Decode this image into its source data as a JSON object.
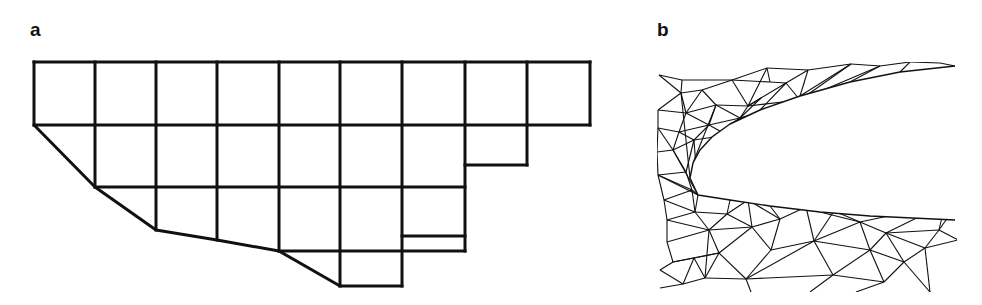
{
  "panels": [
    {
      "label": "a",
      "title": "structured quadrilateral grid with stair-step cells and cut boundary"
    },
    {
      "label": "b",
      "title": "unstructured triangular mesh around leading edge"
    }
  ],
  "colors": {
    "line": "#111111",
    "background": "#ffffff"
  },
  "grid_a": {
    "stroke_width": 3,
    "segments": [
      [
        34,
        62,
        590,
        62
      ],
      [
        34,
        125,
        590,
        125
      ],
      [
        95,
        187,
        465,
        187
      ],
      [
        279,
        251,
        465,
        251
      ],
      [
        340,
        286,
        402,
        286
      ],
      [
        465,
        165,
        527,
        165
      ],
      [
        402,
        236,
        465,
        236
      ],
      [
        34,
        62,
        34,
        125
      ],
      [
        95,
        62,
        95,
        187
      ],
      [
        156,
        62,
        156,
        230
      ],
      [
        217,
        62,
        217,
        240
      ],
      [
        279,
        62,
        279,
        251
      ],
      [
        340,
        62,
        340,
        286
      ],
      [
        402,
        62,
        402,
        286
      ],
      [
        465,
        62,
        465,
        251
      ],
      [
        527,
        62,
        527,
        165
      ],
      [
        590,
        62,
        590,
        125
      ]
    ],
    "boundary": [
      [
        34,
        125
      ],
      [
        95,
        187
      ],
      [
        156,
        230
      ],
      [
        217,
        240
      ],
      [
        279,
        251
      ],
      [
        340,
        286
      ]
    ]
  },
  "mesh_b": {
    "stroke_width": 1.1,
    "body_upper": [
      [
        955,
        66
      ],
      [
        900,
        72
      ],
      [
        850,
        82
      ],
      [
        800,
        96
      ],
      [
        760,
        110
      ],
      [
        730,
        124
      ],
      [
        712,
        137
      ],
      [
        700,
        150
      ],
      [
        693,
        163
      ],
      [
        690,
        178
      ],
      [
        698,
        195
      ]
    ],
    "body_lower": [
      [
        698,
        195
      ],
      [
        730,
        200
      ],
      [
        770,
        206
      ],
      [
        820,
        212
      ],
      [
        870,
        216
      ],
      [
        955,
        220
      ]
    ],
    "nodes": [
      [
        659,
        75
      ],
      [
        682,
        80
      ],
      [
        732,
        80
      ],
      [
        767,
        68
      ],
      [
        808,
        70
      ],
      [
        851,
        64
      ],
      [
        880,
        66
      ],
      [
        910,
        62
      ],
      [
        940,
        63
      ],
      [
        681,
        93
      ],
      [
        702,
        90
      ],
      [
        716,
        105
      ],
      [
        748,
        106
      ],
      [
        740,
        118
      ],
      [
        761,
        98
      ],
      [
        786,
        83
      ],
      [
        800,
        100
      ],
      [
        770,
        82
      ],
      [
        658,
        110
      ],
      [
        686,
        113
      ],
      [
        709,
        125
      ],
      [
        727,
        135
      ],
      [
        694,
        140
      ],
      [
        673,
        150
      ],
      [
        658,
        128
      ],
      [
        679,
        132
      ],
      [
        657,
        152
      ],
      [
        658,
        175
      ],
      [
        686,
        172
      ],
      [
        692,
        190
      ],
      [
        664,
        200
      ],
      [
        667,
        220
      ],
      [
        695,
        212
      ],
      [
        709,
        230
      ],
      [
        727,
        214
      ],
      [
        748,
        200
      ],
      [
        752,
        227
      ],
      [
        719,
        253
      ],
      [
        705,
        278
      ],
      [
        746,
        279
      ],
      [
        771,
        250
      ],
      [
        780,
        219
      ],
      [
        806,
        207
      ],
      [
        814,
        241
      ],
      [
        833,
        275
      ],
      [
        834,
        211
      ],
      [
        860,
        222
      ],
      [
        870,
        250
      ],
      [
        884,
        282
      ],
      [
        886,
        233
      ],
      [
        904,
        262
      ],
      [
        925,
        248
      ],
      [
        939,
        230
      ],
      [
        945,
        204
      ],
      [
        953,
        210
      ],
      [
        958,
        240
      ],
      [
        667,
        242
      ],
      [
        673,
        262
      ],
      [
        694,
        258
      ],
      [
        683,
        284
      ],
      [
        660,
        270
      ],
      [
        660,
        288
      ],
      [
        751,
        292
      ],
      [
        810,
        292
      ],
      [
        856,
        292
      ],
      [
        930,
        292
      ]
    ],
    "edges": [
      [
        0,
        1
      ],
      [
        1,
        2
      ],
      [
        2,
        3
      ],
      [
        3,
        4
      ],
      [
        4,
        5
      ],
      [
        5,
        6
      ],
      [
        6,
        7
      ],
      [
        7,
        8
      ],
      [
        0,
        9
      ],
      [
        1,
        9
      ],
      [
        9,
        10
      ],
      [
        10,
        2
      ],
      [
        10,
        11
      ],
      [
        11,
        12
      ],
      [
        12,
        2
      ],
      [
        2,
        17
      ],
      [
        17,
        3
      ],
      [
        3,
        12
      ],
      [
        12,
        14
      ],
      [
        14,
        13
      ],
      [
        13,
        11
      ],
      [
        12,
        13
      ],
      [
        17,
        15
      ],
      [
        15,
        4
      ],
      [
        15,
        16
      ],
      [
        16,
        12
      ],
      [
        16,
        13
      ],
      [
        15,
        14
      ],
      [
        14,
        12
      ],
      [
        5,
        16
      ],
      [
        6,
        16
      ],
      [
        9,
        18
      ],
      [
        18,
        19
      ],
      [
        19,
        9
      ],
      [
        19,
        10
      ],
      [
        19,
        11
      ],
      [
        19,
        20
      ],
      [
        20,
        11
      ],
      [
        20,
        13
      ],
      [
        20,
        21
      ],
      [
        21,
        13
      ],
      [
        21,
        22
      ],
      [
        22,
        20
      ],
      [
        22,
        23
      ],
      [
        23,
        25
      ],
      [
        25,
        22
      ],
      [
        25,
        20
      ],
      [
        25,
        19
      ],
      [
        24,
        25
      ],
      [
        24,
        18
      ],
      [
        24,
        23
      ],
      [
        23,
        26
      ],
      [
        26,
        24
      ],
      [
        26,
        27
      ],
      [
        27,
        28
      ],
      [
        28,
        23
      ],
      [
        28,
        22
      ],
      [
        28,
        29
      ],
      [
        29,
        27
      ],
      [
        27,
        30
      ],
      [
        30,
        29
      ],
      [
        29,
        32
      ],
      [
        32,
        30
      ],
      [
        30,
        31
      ],
      [
        31,
        32
      ],
      [
        32,
        33
      ],
      [
        33,
        31
      ],
      [
        32,
        34
      ],
      [
        34,
        33
      ],
      [
        34,
        35
      ],
      [
        35,
        36
      ],
      [
        36,
        34
      ],
      [
        36,
        33
      ],
      [
        33,
        37
      ],
      [
        37,
        36
      ],
      [
        37,
        38
      ],
      [
        38,
        33
      ],
      [
        31,
        56
      ],
      [
        56,
        33
      ],
      [
        56,
        57
      ],
      [
        57,
        37
      ],
      [
        57,
        58
      ],
      [
        58,
        37
      ],
      [
        58,
        38
      ],
      [
        58,
        59
      ],
      [
        59,
        38
      ],
      [
        57,
        60
      ],
      [
        60,
        59
      ],
      [
        59,
        61
      ],
      [
        35,
        41
      ],
      [
        41,
        36
      ],
      [
        36,
        40
      ],
      [
        40,
        41
      ],
      [
        41,
        42
      ],
      [
        42,
        43
      ],
      [
        43,
        40
      ],
      [
        40,
        39
      ],
      [
        39,
        37
      ],
      [
        39,
        38
      ],
      [
        39,
        62
      ],
      [
        43,
        39
      ],
      [
        43,
        44
      ],
      [
        44,
        39
      ],
      [
        44,
        63
      ],
      [
        42,
        45
      ],
      [
        45,
        43
      ],
      [
        45,
        46
      ],
      [
        46,
        43
      ],
      [
        46,
        47
      ],
      [
        47,
        43
      ],
      [
        47,
        44
      ],
      [
        47,
        48
      ],
      [
        48,
        44
      ],
      [
        48,
        64
      ],
      [
        46,
        49
      ],
      [
        49,
        47
      ],
      [
        49,
        50
      ],
      [
        50,
        47
      ],
      [
        50,
        48
      ],
      [
        49,
        51
      ],
      [
        51,
        50
      ],
      [
        51,
        52
      ],
      [
        52,
        49
      ],
      [
        52,
        53
      ],
      [
        53,
        49
      ],
      [
        53,
        54
      ],
      [
        54,
        52
      ],
      [
        52,
        55
      ],
      [
        55,
        51
      ],
      [
        50,
        65
      ],
      [
        51,
        65
      ],
      [
        46,
        53
      ],
      [
        45,
        53
      ]
    ],
    "boundary_ties": [
      [
        9,
        "u",
        9
      ],
      [
        11,
        "u",
        8
      ],
      [
        13,
        "u",
        6
      ],
      [
        16,
        "u",
        5
      ],
      [
        15,
        "u",
        4
      ],
      [
        23,
        "u",
        10
      ],
      [
        22,
        "u",
        10
      ],
      [
        27,
        "u",
        10
      ],
      [
        29,
        "l",
        0
      ],
      [
        32,
        "l",
        0
      ],
      [
        34,
        "l",
        1
      ],
      [
        35,
        "l",
        1
      ],
      [
        41,
        "l",
        2
      ],
      [
        42,
        "l",
        2
      ],
      [
        45,
        "l",
        3
      ],
      [
        46,
        "l",
        3
      ],
      [
        53,
        "l",
        4
      ],
      [
        54,
        "l",
        5
      ],
      [
        5,
        "u",
        3
      ],
      [
        6,
        "u",
        2
      ],
      [
        7,
        "u",
        1
      ],
      [
        8,
        "u",
        0
      ],
      [
        4,
        "u",
        3
      ]
    ]
  }
}
